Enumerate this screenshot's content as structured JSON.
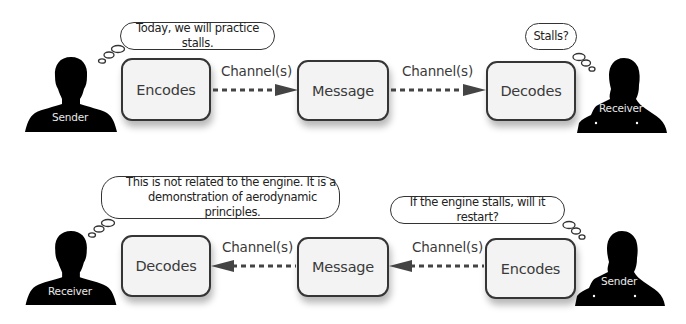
{
  "top_flow": {
    "sender_label": "Sender",
    "receiver_label": "Receiver",
    "sender_bubble": "Today, we will practice stalls.",
    "receiver_bubble": "Stalls?",
    "boxes": [
      {
        "label": "Encodes"
      },
      {
        "label": "Message"
      },
      {
        "label": "Decodes"
      }
    ],
    "channels": [
      {
        "label": "Channel(s)",
        "direction": "right"
      },
      {
        "label": "Channel(s)",
        "direction": "right"
      }
    ]
  },
  "bottom_flow": {
    "receiver_label": "Receiver",
    "sender_label": "Sender",
    "receiver_bubble": "This is not related to the engine. It is a demonstration of aerodynamic principles.",
    "receiver_bubble_lines": [
      "This is not related to the engine. It is a",
      "demonstration of aerodynamic principles."
    ],
    "sender_bubble": "If the engine stalls, will it restart?",
    "boxes": [
      {
        "label": "Decodes"
      },
      {
        "label": "Message"
      },
      {
        "label": "Encodes"
      }
    ],
    "channels": [
      {
        "label": "Channel(s)",
        "direction": "left"
      },
      {
        "label": "Channel(s)",
        "direction": "left"
      }
    ]
  },
  "colors": {
    "box_fill": "#f3f3f3",
    "box_border": "#353535",
    "silhouette": "#000000",
    "text": "#3a3a3a"
  }
}
